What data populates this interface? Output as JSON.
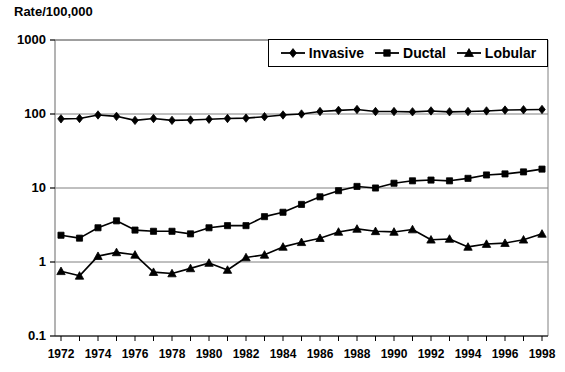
{
  "chart_data": {
    "type": "line",
    "title": "",
    "ylabel": "Rate/100,000",
    "xlabel": "",
    "yscale": "log",
    "ylim": [
      0.1,
      1000
    ],
    "ytick_labels": [
      "1000",
      "100",
      "10",
      "1",
      "0.1"
    ],
    "ytick_values": [
      1000,
      100,
      10,
      1,
      0.1
    ],
    "grid": true,
    "grid_axis": "y",
    "legend_position": "top-right",
    "x": [
      1972,
      1973,
      1974,
      1975,
      1976,
      1977,
      1978,
      1979,
      1980,
      1981,
      1982,
      1983,
      1984,
      1985,
      1986,
      1987,
      1988,
      1989,
      1990,
      1991,
      1992,
      1993,
      1994,
      1995,
      1996,
      1997,
      1998
    ],
    "xtick_labels": [
      "1972",
      "1974",
      "1976",
      "1978",
      "1980",
      "1982",
      "1984",
      "1986",
      "1988",
      "1990",
      "1992",
      "1994",
      "1996",
      "1998"
    ],
    "xtick_label_values": [
      1972,
      1974,
      1976,
      1978,
      1980,
      1982,
      1984,
      1986,
      1988,
      1990,
      1992,
      1994,
      1996,
      1998
    ],
    "series": [
      {
        "name": "Invasive",
        "marker": "diamond",
        "values": [
          86,
          87,
          97,
          93,
          82,
          87,
          82,
          83,
          85,
          87,
          88,
          92,
          97,
          100,
          108,
          112,
          115,
          108,
          108,
          107,
          110,
          107,
          108,
          110,
          113,
          114,
          115
        ]
      },
      {
        "name": "Ductal",
        "marker": "square",
        "values": [
          2.3,
          2.1,
          2.9,
          3.6,
          2.7,
          2.6,
          2.6,
          2.4,
          2.9,
          3.1,
          3.1,
          4.1,
          4.7,
          6.0,
          7.6,
          9.2,
          10.5,
          10.0,
          11.6,
          12.5,
          12.8,
          12.5,
          13.5,
          15.0,
          15.5,
          16.5,
          18.0
        ]
      },
      {
        "name": "Lobular",
        "marker": "triangle",
        "values": [
          0.75,
          0.65,
          1.2,
          1.35,
          1.25,
          0.73,
          0.7,
          0.82,
          0.97,
          0.78,
          1.15,
          1.25,
          1.6,
          1.85,
          2.1,
          2.55,
          2.8,
          2.6,
          2.55,
          2.75,
          2.0,
          2.05,
          1.6,
          1.75,
          1.8,
          2.0,
          2.4
        ]
      }
    ]
  },
  "legend": {
    "items": [
      {
        "label": "Invasive",
        "marker": "diamond"
      },
      {
        "label": "Ductal",
        "marker": "square"
      },
      {
        "label": "Lobular",
        "marker": "triangle"
      }
    ]
  },
  "colors": {
    "series": "#000000",
    "grid": "#808080",
    "axis": "#000000",
    "background": "#ffffff"
  }
}
